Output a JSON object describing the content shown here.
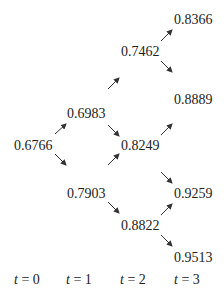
{
  "diagram": {
    "type": "binomial-tree",
    "nodes": {
      "t0": [
        "0.6766"
      ],
      "t1": [
        "0.6983",
        "0.7903"
      ],
      "t2": [
        "0.7462",
        "0.8249",
        "0.8822"
      ],
      "t3": [
        "0.8366",
        "0.8889",
        "0.9259",
        "0.9513"
      ]
    },
    "time_labels": [
      {
        "var": "t",
        "value": "= 0"
      },
      {
        "var": "t",
        "value": "= 1"
      },
      {
        "var": "t",
        "value": "= 2"
      },
      {
        "var": "t",
        "value": "= 3"
      }
    ]
  }
}
